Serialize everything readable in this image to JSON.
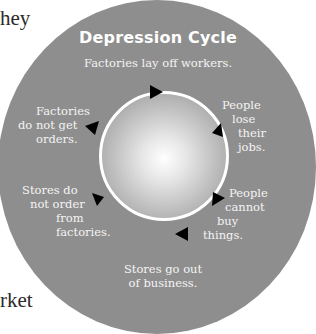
{
  "edge_text": {
    "top_left": "hey",
    "left_fragment": "t",
    "bottom_left": "rket"
  },
  "diagram": {
    "title": "Depression Cycle",
    "steps": [
      {
        "label": "Factories lay off workers."
      },
      {
        "label_lines": [
          "People",
          "lose",
          "their",
          "jobs."
        ]
      },
      {
        "label_lines": [
          "People",
          "cannot",
          "buy",
          "things."
        ]
      },
      {
        "label_lines": [
          "Stores go out",
          "of business."
        ]
      },
      {
        "label_lines": [
          "Stores do",
          "not order",
          "from",
          "factories."
        ]
      },
      {
        "label_lines": [
          "Factories",
          "do not get",
          "orders."
        ]
      }
    ],
    "colors": {
      "outer_circle": "#8e8e8e",
      "cycle_ring": "#ffffff",
      "arrow": "#000000",
      "label_text": "#f4f4f4"
    },
    "arrow_icon": "triangle-arrow-clockwise"
  }
}
